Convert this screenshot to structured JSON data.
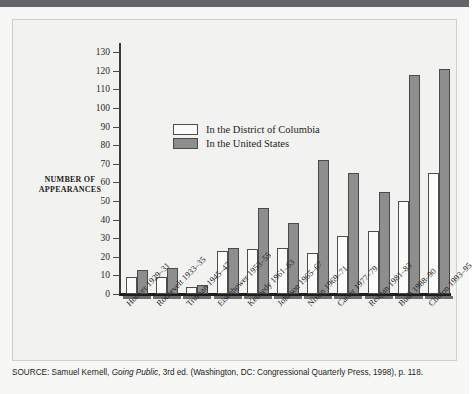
{
  "figure": {
    "axis_title_line1": "NUMBER OF",
    "axis_title_line2": "APPEARANCES"
  },
  "legend": {
    "items": [
      {
        "label": "In the District of Columbia",
        "key": "dc",
        "color": "#fbfbf9"
      },
      {
        "label": "In the United States",
        "key": "us",
        "color": "#8e8e8e"
      }
    ]
  },
  "source": {
    "label": "SOURCE:",
    "author": " Samuel Kernell, ",
    "title": "Going Public",
    "rest": ", 3rd ed. (Washington, DC: Congressional Quarterly Press, 1998), p. 118."
  },
  "chart_data": {
    "type": "bar",
    "title": "",
    "xlabel": "",
    "ylabel": "NUMBER OF APPEARANCES",
    "ylim": [
      0,
      135
    ],
    "yticks": [
      0,
      10,
      20,
      30,
      40,
      50,
      60,
      70,
      80,
      90,
      100,
      110,
      120,
      130
    ],
    "grid": false,
    "legend_position": "inside-upper-left",
    "categories": [
      "Hoover 1929–31",
      "Roosevelt 1933–35",
      "Truman 1945–47",
      "Eisenhower 1953–55",
      "Kennedy 1961–63",
      "Johnson 1965–67",
      "Nixon 1969–71",
      "Carter 1977–79",
      "Reagan 1981–83",
      "Bush 1988–90",
      "Clinton 1993–95"
    ],
    "series": [
      {
        "name": "In the District of Columbia",
        "color": "#fbfbf9",
        "values": [
          9,
          9,
          4,
          23,
          24,
          25,
          22,
          31,
          34,
          50,
          65
        ]
      },
      {
        "name": "In the United States",
        "color": "#8e8e8e",
        "values": [
          13,
          14,
          5,
          25,
          46,
          38,
          72,
          65,
          55,
          118,
          121
        ]
      }
    ]
  }
}
